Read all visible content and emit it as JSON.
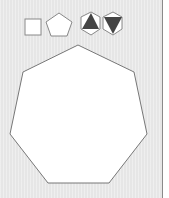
{
  "toolbar": {
    "shapes": [
      {
        "name": "square",
        "icon": "square-icon",
        "selected": false
      },
      {
        "name": "pentagon",
        "icon": "pentagon-icon",
        "selected": false
      },
      {
        "name": "hexagon-triangle-up",
        "icon": "hexagon-triangle-up-icon",
        "selected": false
      },
      {
        "name": "hexagon-triangle-down",
        "icon": "hexagon-triangle-down-icon",
        "selected": false
      }
    ]
  },
  "canvas": {
    "shape": "heptagon",
    "fill": "#ffffff",
    "stroke": "#777777"
  },
  "colors": {
    "background": "#e6e6e6",
    "shape_fill": "#ffffff",
    "shape_stroke": "#777777",
    "triangle_fill": "#444444",
    "divider": "#8a8a8a"
  }
}
